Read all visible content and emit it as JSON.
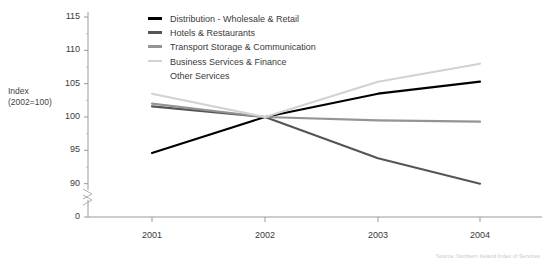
{
  "axis_title": "Index\n(2002=100)",
  "legend": {
    "position": "top-center",
    "entries": [
      {
        "label": "Distribution - Wholesale & Retail",
        "color": "#000000",
        "swatch": true
      },
      {
        "label": "Hotels & Restaurants",
        "color": "#555555",
        "swatch": true
      },
      {
        "label": "Transport Storage & Communication",
        "color": "#949494",
        "swatch": true
      },
      {
        "label": "Business Services & Finance",
        "color": "#d2d2d2",
        "swatch": true
      },
      {
        "label": "Other Services",
        "color": "#d2d2d2",
        "swatch": false
      }
    ]
  },
  "source_note": "Source: Northern Ireland Index of Services",
  "chart_data": {
    "type": "line",
    "title": "",
    "subtitle": "",
    "xlabel": "",
    "ylabel": "Index (2002=100)",
    "x": [
      "2001",
      "2002",
      "2003",
      "2004"
    ],
    "categories": [
      "2001",
      "2002",
      "2003",
      "2004"
    ],
    "yticks": [
      90,
      95,
      100,
      105,
      110,
      115
    ],
    "ytick_labels": [
      "90",
      "95",
      "100",
      "105",
      "110",
      "115"
    ],
    "y_zero_label": "0",
    "ylim": [
      90,
      115
    ],
    "axis_break": true,
    "grid": false,
    "legend_position": "top-center",
    "series": [
      {
        "name": "Distribution - Wholesale & Retail",
        "color": "#000000",
        "width": 2.1,
        "values": [
          94.6,
          100.0,
          103.5,
          105.3
        ]
      },
      {
        "name": "Hotels & Restaurants",
        "color": "#555555",
        "width": 2.1,
        "values": [
          101.6,
          100.0,
          93.8,
          90.0
        ]
      },
      {
        "name": "Transport Storage & Communication",
        "color": "#949494",
        "width": 2.1,
        "values": [
          102.0,
          100.0,
          99.5,
          99.3
        ]
      },
      {
        "name": "Business Services & Finance / Other Services",
        "color": "#d2d2d2",
        "width": 2.1,
        "values": [
          103.5,
          100.0,
          105.3,
          108.0
        ]
      }
    ]
  }
}
